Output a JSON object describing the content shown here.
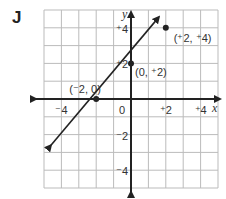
{
  "problem_label": "J",
  "chart_data": {
    "type": "line",
    "title": "J",
    "xlabel": "x",
    "ylabel": "y",
    "xlim": [
      -5,
      5
    ],
    "ylim": [
      -5,
      5
    ],
    "grid": true,
    "x_tick_labels": [
      "-4",
      "0",
      "+2",
      "+4"
    ],
    "y_tick_labels": [
      "+4",
      "+2",
      "-2",
      "-4"
    ],
    "x_tick_display": [
      "⁻4",
      "0",
      "⁺2",
      "⁺4"
    ],
    "y_tick_display": [
      "⁺4",
      "⁺2",
      "⁻2",
      "⁻4"
    ],
    "series": [
      {
        "name": "line",
        "equation": "y = x + 2",
        "x": [
          -4.6,
          1.6
        ],
        "y": [
          -2.6,
          4.6
        ],
        "arrows": "both"
      }
    ],
    "points": [
      {
        "x": -2,
        "y": 0,
        "label": "(⁻2, 0)"
      },
      {
        "x": 0,
        "y": 2,
        "label": "(0, ⁺2)"
      },
      {
        "x": 2,
        "y": 4,
        "label": "(⁺2, ⁺4)"
      }
    ]
  }
}
